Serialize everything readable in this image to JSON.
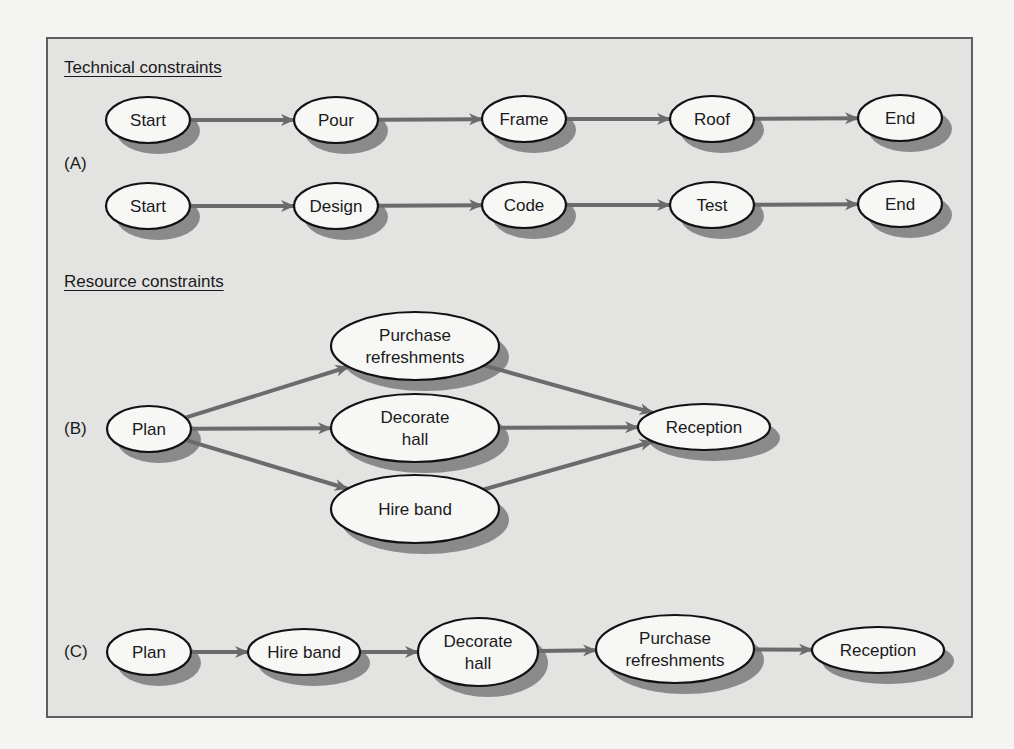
{
  "figure": {
    "sections": {
      "technical": {
        "heading": "Technical constraints"
      },
      "resource": {
        "heading": "Resource constraints"
      }
    },
    "part_labels": {
      "A": "(A)",
      "B": "(B)",
      "C": "(C)"
    }
  },
  "colors": {
    "panel_bg": "#e3e3e2",
    "panel_border": "#5e5e5e",
    "node_fill": "#f7f7f6",
    "node_stroke": "#111111",
    "node_shadow": "#8a8a8a",
    "arrow": "#6b6b6b"
  },
  "nodes": [
    {
      "id": "a1_start",
      "part": "A",
      "lines": [
        "Start"
      ],
      "cx": 148,
      "cy": 120,
      "rx": 42,
      "ry": 23
    },
    {
      "id": "a1_pour",
      "part": "A",
      "lines": [
        "Pour"
      ],
      "cx": 336,
      "cy": 120,
      "rx": 42,
      "ry": 23
    },
    {
      "id": "a1_frame",
      "part": "A",
      "lines": [
        "Frame"
      ],
      "cx": 524,
      "cy": 119,
      "rx": 42,
      "ry": 23
    },
    {
      "id": "a1_roof",
      "part": "A",
      "lines": [
        "Roof"
      ],
      "cx": 712,
      "cy": 119,
      "rx": 42,
      "ry": 23
    },
    {
      "id": "a1_end",
      "part": "A",
      "lines": [
        "End"
      ],
      "cx": 900,
      "cy": 118,
      "rx": 42,
      "ry": 23
    },
    {
      "id": "a2_start",
      "part": "A",
      "lines": [
        "Start"
      ],
      "cx": 148,
      "cy": 206,
      "rx": 42,
      "ry": 23
    },
    {
      "id": "a2_design",
      "part": "A",
      "lines": [
        "Design"
      ],
      "cx": 336,
      "cy": 206,
      "rx": 42,
      "ry": 23
    },
    {
      "id": "a2_code",
      "part": "A",
      "lines": [
        "Code"
      ],
      "cx": 524,
      "cy": 205,
      "rx": 42,
      "ry": 23
    },
    {
      "id": "a2_test",
      "part": "A",
      "lines": [
        "Test"
      ],
      "cx": 712,
      "cy": 205,
      "rx": 42,
      "ry": 23
    },
    {
      "id": "a2_end",
      "part": "A",
      "lines": [
        "End"
      ],
      "cx": 900,
      "cy": 204,
      "rx": 42,
      "ry": 23
    },
    {
      "id": "b_plan",
      "part": "B",
      "lines": [
        "Plan"
      ],
      "cx": 149,
      "cy": 429,
      "rx": 42,
      "ry": 23
    },
    {
      "id": "b_purchase",
      "part": "B",
      "lines": [
        "Purchase",
        "refreshments"
      ],
      "cx": 415,
      "cy": 346,
      "rx": 84,
      "ry": 34
    },
    {
      "id": "b_decorate",
      "part": "B",
      "lines": [
        "Decorate",
        "hall"
      ],
      "cx": 415,
      "cy": 428,
      "rx": 84,
      "ry": 34
    },
    {
      "id": "b_hireband",
      "part": "B",
      "lines": [
        "Hire band"
      ],
      "cx": 415,
      "cy": 509,
      "rx": 84,
      "ry": 34
    },
    {
      "id": "b_reception",
      "part": "B",
      "lines": [
        "Reception"
      ],
      "cx": 704,
      "cy": 427,
      "rx": 66,
      "ry": 23
    },
    {
      "id": "c_plan",
      "part": "C",
      "lines": [
        "Plan"
      ],
      "cx": 149,
      "cy": 652,
      "rx": 42,
      "ry": 23
    },
    {
      "id": "c_hireband",
      "part": "C",
      "lines": [
        "Hire band"
      ],
      "cx": 304,
      "cy": 652,
      "rx": 56,
      "ry": 23
    },
    {
      "id": "c_decorate",
      "part": "C",
      "lines": [
        "Decorate",
        "hall"
      ],
      "cx": 478,
      "cy": 652,
      "rx": 60,
      "ry": 34
    },
    {
      "id": "c_purchase",
      "part": "C",
      "lines": [
        "Purchase",
        "refreshments"
      ],
      "cx": 675,
      "cy": 649,
      "rx": 79,
      "ry": 34
    },
    {
      "id": "c_reception",
      "part": "C",
      "lines": [
        "Reception"
      ],
      "cx": 878,
      "cy": 650,
      "rx": 66,
      "ry": 23
    }
  ],
  "edges": [
    {
      "from": "a1_start",
      "to": "a1_pour"
    },
    {
      "from": "a1_pour",
      "to": "a1_frame"
    },
    {
      "from": "a1_frame",
      "to": "a1_roof"
    },
    {
      "from": "a1_roof",
      "to": "a1_end"
    },
    {
      "from": "a2_start",
      "to": "a2_design"
    },
    {
      "from": "a2_design",
      "to": "a2_code"
    },
    {
      "from": "a2_code",
      "to": "a2_test"
    },
    {
      "from": "a2_test",
      "to": "a2_end"
    },
    {
      "from": "b_plan",
      "to": "b_purchase"
    },
    {
      "from": "b_plan",
      "to": "b_decorate"
    },
    {
      "from": "b_plan",
      "to": "b_hireband"
    },
    {
      "from": "b_purchase",
      "to": "b_reception"
    },
    {
      "from": "b_decorate",
      "to": "b_reception"
    },
    {
      "from": "b_hireband",
      "to": "b_reception"
    },
    {
      "from": "c_plan",
      "to": "c_hireband"
    },
    {
      "from": "c_hireband",
      "to": "c_decorate"
    },
    {
      "from": "c_decorate",
      "to": "c_purchase"
    },
    {
      "from": "c_purchase",
      "to": "c_reception"
    }
  ]
}
